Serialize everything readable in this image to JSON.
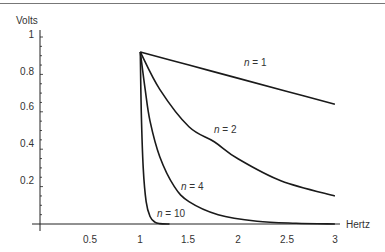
{
  "chart_data": {
    "type": "line",
    "title": "",
    "xlabel": "Hertz",
    "ylabel": "Volts",
    "xlim": [
      0,
      3
    ],
    "ylim": [
      0,
      1
    ],
    "x_ticks": [
      "0.5",
      "1",
      "1.5",
      "2",
      "2.5",
      "3"
    ],
    "x_tick_values": [
      0.5,
      1,
      1.5,
      2,
      2.5,
      3
    ],
    "y_ticks": [
      "0.2",
      "0.4",
      "0.6",
      "0.8",
      "1"
    ],
    "y_tick_values": [
      0.2,
      0.4,
      0.6,
      0.8,
      1
    ],
    "grid": false,
    "legend": "inline labels",
    "series": [
      {
        "name": "n = 1",
        "x": [
          1,
          1.5,
          2,
          2.5,
          3
        ],
        "values": [
          0.92,
          0.85,
          0.78,
          0.71,
          0.64
        ]
      },
      {
        "name": "n = 2",
        "x": [
          1,
          1.2,
          1.5,
          1.76,
          2,
          2.45,
          3
        ],
        "values": [
          0.92,
          0.72,
          0.52,
          0.44,
          0.35,
          0.23,
          0.15
        ]
      },
      {
        "name": "n = 4",
        "x": [
          1,
          1.05,
          1.1,
          1.2,
          1.35,
          1.5,
          1.8,
          2.2,
          2.6,
          3
        ],
        "values": [
          0.92,
          0.72,
          0.55,
          0.36,
          0.2,
          0.12,
          0.05,
          0.015,
          0.004,
          0.0
        ]
      },
      {
        "name": "n = 10",
        "x": [
          1,
          1.01,
          1.03,
          1.06,
          1.1,
          1.15,
          1.2,
          1.3
        ],
        "values": [
          0.92,
          0.6,
          0.3,
          0.12,
          0.04,
          0.01,
          0.002,
          0.0
        ]
      }
    ]
  },
  "labels": {
    "y_axis": "Volts",
    "x_axis": "Hertz",
    "n1": {
      "var": "n",
      "rest": " = 1"
    },
    "n2": {
      "var": "n",
      "rest": " = 2"
    },
    "n4": {
      "var": "n",
      "rest": " = 4"
    },
    "n10": {
      "var": "n",
      "rest": " = 10"
    },
    "x_ticks": [
      "0.5",
      "1",
      "1.5",
      "2",
      "2.5",
      "3"
    ],
    "y_ticks": [
      "0.2",
      "0.4",
      "0.6",
      "0.8",
      "1"
    ]
  }
}
